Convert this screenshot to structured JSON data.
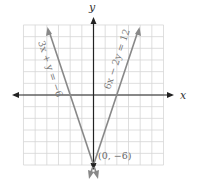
{
  "chart_data": {
    "type": "line",
    "title": "",
    "xlabel": "x",
    "ylabel": "y",
    "xlim": [
      -6,
      6
    ],
    "ylim": [
      -6,
      6
    ],
    "grid": true,
    "series": [
      {
        "name": "3x + y = −6",
        "equation": "y = -3x - 6",
        "points": [
          [
            -4,
            6
          ],
          [
            -2,
            0
          ],
          [
            0,
            -6
          ]
        ]
      },
      {
        "name": "6x − 2y = 12",
        "equation": "y = 3x - 6",
        "points": [
          [
            4,
            6
          ],
          [
            2,
            0
          ],
          [
            0,
            -6
          ]
        ]
      }
    ],
    "annotations": [
      {
        "text": "(0, −6)",
        "x": 0,
        "y": -6
      }
    ]
  },
  "labels": {
    "x_axis": "x",
    "y_axis": "y",
    "eq1": "3x + y = −6",
    "eq2": "6x − 2y = 12",
    "point": "(0, −6)"
  }
}
